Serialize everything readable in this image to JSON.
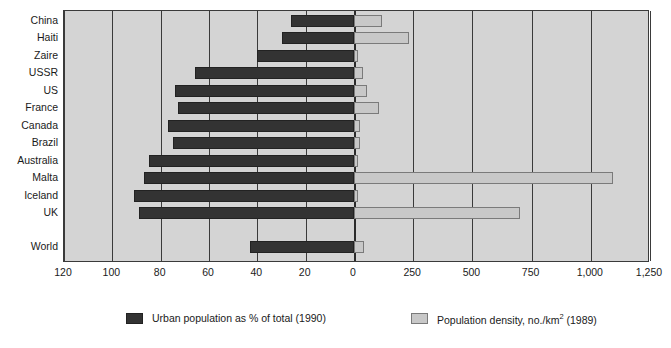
{
  "chart_data": {
    "type": "bar",
    "orientation": "horizontal",
    "title": "",
    "subtitle": "",
    "xlabel": "",
    "ylabel": "",
    "grid": true,
    "legend_position": "bottom",
    "categories": [
      "China",
      "Haiti",
      "Zaire",
      "USSR",
      "US",
      "France",
      "Canada",
      "Brazil",
      "Australia",
      "Malta",
      "Iceland",
      "UK",
      "World"
    ],
    "left_axis": {
      "name": "Urban population as % of total (1990)",
      "ticks": [
        "120",
        "100",
        "80",
        "60",
        "40",
        "20",
        "0"
      ],
      "tick_values": [
        120,
        100,
        80,
        60,
        40,
        20,
        0
      ],
      "direction": "right-to-left",
      "lim": [
        120,
        0
      ]
    },
    "right_axis": {
      "name": "Population density, no./km2 (1989)",
      "ticks": [
        "0",
        "250",
        "500",
        "750",
        "1,000",
        "1,250"
      ],
      "tick_values": [
        0,
        250,
        500,
        750,
        1000,
        1250
      ],
      "direction": "left-to-right",
      "lim": [
        0,
        1250
      ]
    },
    "series": [
      {
        "name": "Urban population as % of total (1990)",
        "axis": "left",
        "color": "#333333",
        "values": [
          26,
          30,
          40,
          66,
          74,
          73,
          77,
          75,
          85,
          87,
          91,
          89,
          43
        ]
      },
      {
        "name": "Population density, no./km2 (1989)",
        "axis": "right",
        "color": "#c8c8c8",
        "values": [
          118,
          232,
          16,
          38,
          55,
          105,
          25,
          24,
          2,
          1095,
          10,
          700,
          42
        ]
      }
    ]
  },
  "legend": {
    "items": [
      {
        "label": "Urban population as % of total (1990)",
        "swatch": "dark"
      },
      {
        "label_before": "Population density, no./km",
        "label_sup": "2",
        "label_after": " (1989)",
        "swatch": "light"
      }
    ]
  },
  "colors": {
    "plot_background": "#d4d4d4",
    "frame": "#3a3a3a",
    "bar_dark": "#333333",
    "bar_light": "#c8c8c8",
    "page_background": "#ffffff",
    "text": "#1a1a1a"
  }
}
